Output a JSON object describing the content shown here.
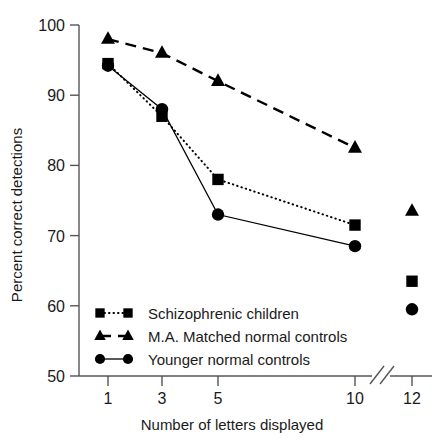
{
  "chart_data": {
    "type": "line",
    "title": "",
    "xlabel": "Number of letters displayed",
    "ylabel": "Percent correct detections",
    "x": [
      1,
      3,
      5,
      10,
      12
    ],
    "xtick_labels": [
      "1",
      "3",
      "5",
      "10",
      "12"
    ],
    "ytick_labels": [
      "50",
      "60",
      "70",
      "80",
      "90",
      "100"
    ],
    "xlim": [
      0,
      13
    ],
    "ylim": [
      50,
      100
    ],
    "grid": false,
    "axis_break": {
      "between": [
        10,
        12
      ],
      "note": "x-axis break drawn as double slash between 10 and 12"
    },
    "legend_position": "inside lower left",
    "series": [
      {
        "name": "Schizophrenic children",
        "marker": "square",
        "linestyle": "dotted",
        "color": "#000000",
        "values": [
          94.5,
          87.0,
          78.0,
          71.5,
          63.5
        ],
        "connected_through": [
          1,
          3,
          5,
          10
        ]
      },
      {
        "name": "M.A. Matched normal controls",
        "marker": "triangle",
        "linestyle": "dashed",
        "color": "#000000",
        "values": [
          98.0,
          96.0,
          92.0,
          82.5,
          73.5
        ],
        "connected_through": [
          1,
          3,
          5,
          10
        ]
      },
      {
        "name": "Younger normal controls",
        "marker": "circle",
        "linestyle": "solid",
        "color": "#000000",
        "values": [
          94.2,
          88.0,
          73.0,
          68.5,
          59.5
        ],
        "connected_through": [
          1,
          3,
          5,
          10
        ]
      }
    ]
  },
  "axes": {
    "y_title": "Percent correct detections",
    "x_title": "Number of letters displayed",
    "y_ticks": [
      "100",
      "90",
      "80",
      "70",
      "60",
      "50"
    ],
    "x_ticks": [
      "1",
      "3",
      "5",
      "10",
      "12"
    ]
  },
  "legend": {
    "entries": [
      {
        "label": "Schizophrenic children",
        "marker": "square",
        "linestyle": "dotted"
      },
      {
        "label": "M.A. Matched normal controls",
        "marker": "triangle",
        "linestyle": "dashed"
      },
      {
        "label": "Younger normal controls",
        "marker": "circle",
        "linestyle": "solid"
      }
    ]
  }
}
